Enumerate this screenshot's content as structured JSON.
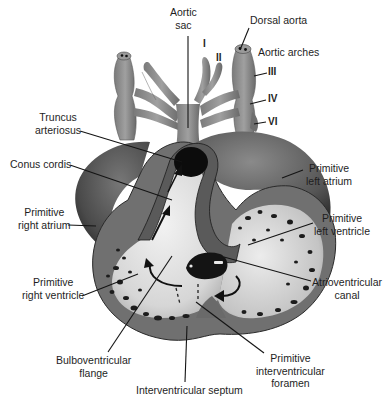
{
  "labels": {
    "aortic_sac": [
      "Aortic",
      "sac"
    ],
    "dorsal_aorta": [
      "Dorsal aorta"
    ],
    "aortic_arches": [
      "Aortic arches"
    ],
    "arch_I": "I",
    "arch_II": "II",
    "arch_III": "III",
    "arch_IV": "IV",
    "arch_VI": "VI",
    "truncus_arteriosus": [
      "Truncus",
      "arteriosus"
    ],
    "conus_cordis": [
      "Conus cordis"
    ],
    "primitive_left_atrium": [
      "Primitive",
      "left atrium"
    ],
    "primitive_right_atrium": [
      "Primitive",
      "right atrium"
    ],
    "primitive_left_ventricle": [
      "Primitive",
      "left ventricle"
    ],
    "atrioventricular_canal": [
      "Atrioventricular",
      "canal"
    ],
    "primitive_right_ventricle": [
      "Primitive",
      "right ventricle"
    ],
    "bulboventricular_flange": [
      "Bulboventricular",
      "flange"
    ],
    "primitive_interventricular_foramen": [
      "Primitive",
      "interventricular",
      "foramen"
    ],
    "interventricular_septum": [
      "Interventricular septum"
    ]
  },
  "colors": {
    "outer_wall": "#6e6e6e",
    "dark_wall": "#3a3a3a",
    "lumen": "#e6e6e6",
    "vessels": "#8c8c8c",
    "text": "#1e1e1e"
  }
}
